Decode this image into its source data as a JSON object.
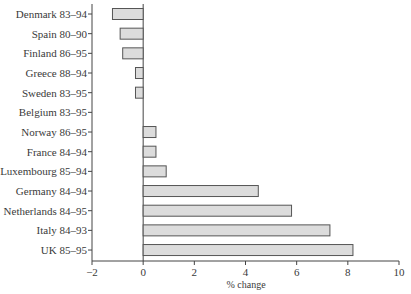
{
  "chart_data": {
    "type": "bar",
    "orientation": "horizontal",
    "title": "",
    "xlabel": "% change",
    "ylabel": "",
    "xlim": [
      -2,
      10
    ],
    "xticks": [
      -2,
      0,
      2,
      4,
      6,
      8,
      10
    ],
    "xtick_labels": [
      "−2",
      "0",
      "2",
      "4",
      "6",
      "8",
      "10"
    ],
    "grid": false,
    "legend": null,
    "categories": [
      "Denmark 83–94",
      "Spain 80–90",
      "Finland 86–95",
      "Greece 88–94",
      "Sweden 83–95",
      "Belgium 83–95",
      "Norway 86–95",
      "France 84–94",
      "Luxembourg 85–94",
      "Germany 84–94",
      "Netherlands 84–95",
      "Italy 84–93",
      "UK 85–95"
    ],
    "values": [
      -1.2,
      -0.9,
      -0.8,
      -0.3,
      -0.3,
      0.0,
      0.5,
      0.5,
      0.9,
      4.5,
      5.8,
      7.3,
      8.2
    ],
    "colors": {
      "bar_fill": "#dcdcdc",
      "bar_stroke": "#555555",
      "axis": "#444444"
    }
  }
}
